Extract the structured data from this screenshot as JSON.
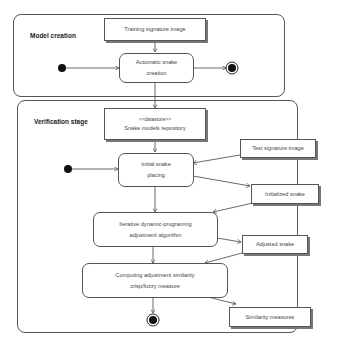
{
  "frames": {
    "model_creation": {
      "label": "Model creation"
    },
    "verification": {
      "label": "Verification stage"
    }
  },
  "objects": {
    "training_image": {
      "label": "Training signature image"
    },
    "datastore": {
      "stereotype": "<<datastore>>",
      "label": "Snake models repository"
    },
    "test_image": {
      "label": "Test signature image"
    },
    "initialized_snake": {
      "label": "Initialized snake"
    },
    "adjusted_snake": {
      "label": "Adjusted snake"
    },
    "similarity_measures": {
      "label": "Similarity measures"
    }
  },
  "activities": {
    "auto_snake": {
      "line1": "Automatic snake",
      "line2": "creation"
    },
    "initial_placing": {
      "line1": "Initial snake",
      "line2": "placing"
    },
    "iterative": {
      "line1": "Iterative dynamic-programing",
      "line2": "adjustment algorithm"
    },
    "computing": {
      "line1": "Computing adjustment similarity",
      "line2": "crisp/fuzzy measure"
    }
  },
  "colors": {
    "line": "#444444",
    "node": "#111111"
  }
}
